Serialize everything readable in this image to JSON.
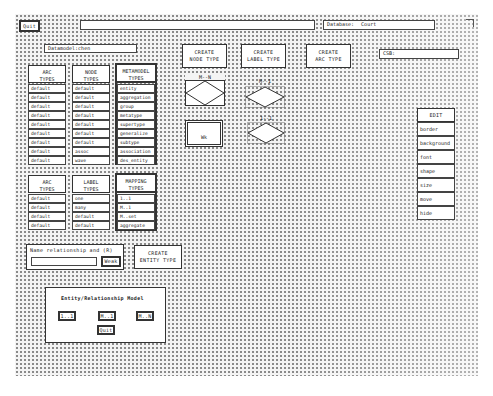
{
  "top_bar": {
    "quit_label": "Quit",
    "title_value": "",
    "database_label": "Database:",
    "database_value": "Court"
  },
  "datamodel": {
    "label": "Datamodel:",
    "value": "chen"
  },
  "toolbar": {
    "create_node_type": "CREATE\nNODE TYPE",
    "create_label_type": "CREATE\nLABEL TYPE",
    "create_arc_type": "CREATE\nARC TYPE"
  },
  "csb": {
    "label": "CSB:",
    "value": ""
  },
  "type_table_1": {
    "columns": [
      {
        "header": "ARC\nTYPES",
        "cells": [
          "default",
          "default",
          "default",
          "default",
          "default",
          "default",
          "default",
          "default",
          "default"
        ]
      },
      {
        "header": "NODE\nTYPES",
        "cells": [
          "default",
          "default",
          "default",
          "default",
          "default",
          "default",
          "default",
          "assoc",
          "wave"
        ]
      },
      {
        "header": "METAMODEL\nTYPES",
        "cells": [
          "entity",
          "aggregation",
          "group",
          "metatype",
          "supertype",
          "generalize",
          "subtype",
          "association",
          "des_entity"
        ]
      }
    ]
  },
  "type_table_2": {
    "columns": [
      {
        "header": "ARC\nTYPES",
        "cells": [
          "default",
          "default",
          "default",
          "default"
        ]
      },
      {
        "header": "LABEL\nTYPES",
        "cells": [
          "one",
          "many",
          "default",
          "default"
        ]
      },
      {
        "header": "MAPPING\nTYPES",
        "cells": [
          "1..1",
          "M..1",
          "M..set",
          "aggregate"
        ]
      }
    ]
  },
  "shapes": {
    "mn_label": "M--N",
    "m1_label": "M--1",
    "one_one_label": "1--1",
    "weak_entity_label": "Wk"
  },
  "edit_menu": {
    "title": "EDIT",
    "items": [
      "border",
      "background",
      "font",
      "shape",
      "size",
      "move",
      "hide"
    ]
  },
  "relationship": {
    "prompt": "Name relationship and (R)",
    "input_value": "",
    "weak_label": "Weak",
    "create_entity_type": "CREATE\nENTITY TYPE"
  },
  "er_model_dialog": {
    "title": "Entity/Relationship Model",
    "btn_1_1": "1..1",
    "btn_m_1": "M..1",
    "btn_m_n": "M..N",
    "quit": "Quit"
  },
  "corner_icon": "resize-corner-icon"
}
